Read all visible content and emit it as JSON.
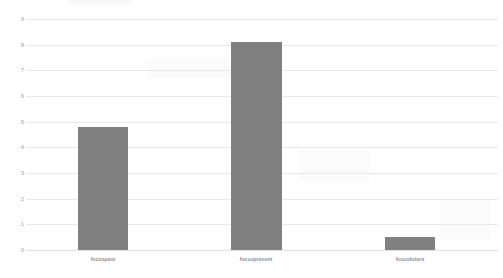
{
  "chart_data": {
    "type": "bar",
    "title": "",
    "subtitle": "",
    "xlabel": "",
    "ylabel": "",
    "categories": [
      "focuspast",
      "focuspresent",
      "focusfuture"
    ],
    "values": [
      4.8,
      8.1,
      0.5
    ],
    "series": [
      {
        "name": "",
        "values": [
          4.8,
          8.1,
          0.5
        ],
        "color": "#808080"
      }
    ],
    "ylim": [
      0,
      9
    ],
    "ytick_labels": [
      "0",
      "1",
      "2",
      "3",
      "4",
      "5",
      "6",
      "7",
      "8",
      "9"
    ],
    "ytick_values": [
      0,
      1,
      2,
      3,
      4,
      5,
      6,
      7,
      8,
      9
    ],
    "grid": true,
    "grid_orientation": "horizontal",
    "grid_color": "#e8e8e8",
    "legend": false,
    "legend_position": "none",
    "background_color": "#ffffff",
    "bar_color": "#808080",
    "annotations": []
  }
}
